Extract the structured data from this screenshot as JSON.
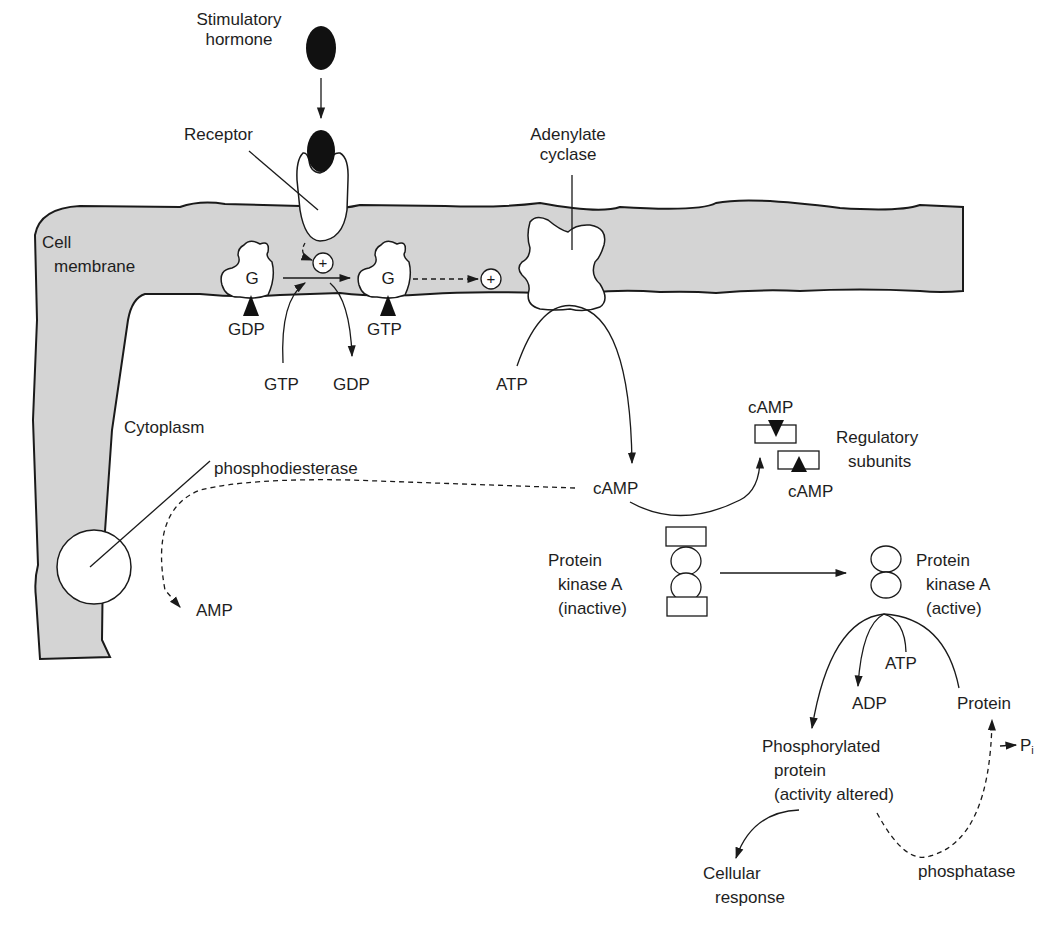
{
  "colors": {
    "membrane_fill": "#d4d4d4",
    "outline": "#1a1a1a",
    "hormone": "#111111",
    "background": "#ffffff"
  },
  "labels": {
    "stimulatory_hormone_1": "Stimulatory",
    "stimulatory_hormone_2": "hormone",
    "receptor": "Receptor",
    "adenylate_cyclase_1": "Adenylate",
    "adenylate_cyclase_2": "cyclase",
    "cell_membrane_1": "Cell",
    "cell_membrane_2": "membrane",
    "g_protein_left": "G",
    "g_protein_right": "G",
    "gdp_bound": "GDP",
    "gtp_bound": "GTP",
    "gtp_in": "GTP",
    "gdp_out": "GDP",
    "plus_sign": "+",
    "atp_cyclase": "ATP",
    "cytoplasm": "Cytoplasm",
    "phosphodiesterase": "phosphodiesterase",
    "camp_main": "cAMP",
    "amp": "AMP",
    "camp_reg_top": "cAMP",
    "camp_reg_bottom": "cAMP",
    "regulatory_1": "Regulatory",
    "regulatory_2": "subunits",
    "pka_inactive_1": "Protein",
    "pka_inactive_2": "kinase A",
    "pka_inactive_3": "(inactive)",
    "pka_active_1": "Protein",
    "pka_active_2": "kinase A",
    "pka_active_3": "(active)",
    "atp_kinase": "ATP",
    "adp": "ADP",
    "protein": "Protein",
    "pi_main": "P",
    "pi_sub": "i",
    "phospho_1": "Phosphorylated",
    "phospho_2": "protein",
    "phospho_3": "(activity altered)",
    "cellular_1": "Cellular",
    "cellular_2": "response",
    "phosphatase": "phosphatase"
  }
}
